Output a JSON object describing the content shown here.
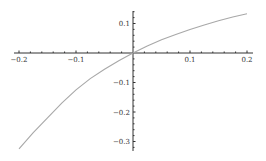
{
  "chart_data": {
    "type": "line",
    "title": "",
    "xlabel": "",
    "ylabel": "",
    "xlim": [
      -0.2,
      0.2
    ],
    "ylim": [
      -0.33,
      0.14
    ],
    "grid": false,
    "legend": null,
    "x_ticks": [
      -0.2,
      -0.1,
      0.1,
      0.2
    ],
    "x_tick_labels": [
      "-0.2",
      "-0.1",
      "0.1",
      "0.2"
    ],
    "y_ticks": [
      0.1,
      -0.1,
      -0.2,
      -0.3
    ],
    "y_tick_labels": [
      "0.1",
      "-0.1",
      "-0.2",
      "-0.3"
    ],
    "series": [
      {
        "name": "curve",
        "color": "#a8a8a8",
        "x": [
          -0.2,
          -0.175,
          -0.15,
          -0.125,
          -0.1,
          -0.075,
          -0.05,
          -0.025,
          0,
          0.025,
          0.05,
          0.075,
          0.1,
          0.125,
          0.15,
          0.175,
          0.2
        ],
        "y": [
          -0.325,
          -0.27,
          -0.22,
          -0.17,
          -0.125,
          -0.087,
          -0.055,
          -0.026,
          0,
          0.024,
          0.045,
          0.063,
          0.08,
          0.095,
          0.109,
          0.122,
          0.133
        ]
      }
    ],
    "minor_ticks_per_major": 5
  }
}
